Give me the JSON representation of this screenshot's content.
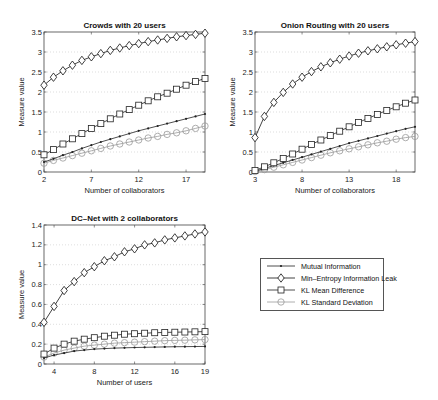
{
  "legend": {
    "items": [
      {
        "label": "Mutual Information",
        "marker": "dot",
        "color": "#222222"
      },
      {
        "label": "Min–Entropy Information Leak",
        "marker": "diamond",
        "color": "#111111"
      },
      {
        "label": "KL Mean Difference",
        "marker": "square",
        "color": "#222222"
      },
      {
        "label": "KL Standard Deviation",
        "marker": "circle",
        "color": "#999999"
      }
    ]
  },
  "chart_data": [
    {
      "type": "line",
      "title": "Crowds with 20 users",
      "xlabel": "Number of collaborators",
      "ylabel": "Measure value",
      "xlim": [
        2,
        19
      ],
      "ylim": [
        0,
        3.5
      ],
      "xticks": [
        2,
        7,
        12,
        17
      ],
      "yticks": [
        0,
        0.5,
        1,
        1.5,
        2,
        2.5,
        3,
        3.5
      ],
      "ytick_labels": [
        "0",
        "0.5",
        "1",
        "1.5",
        "2",
        "2.5",
        "3",
        "3.5"
      ],
      "grid": true,
      "x": [
        2,
        3,
        4,
        5,
        6,
        7,
        8,
        9,
        10,
        11,
        12,
        13,
        14,
        15,
        16,
        17,
        18,
        19
      ],
      "series": [
        {
          "name": "Mutual Information",
          "marker": "dot",
          "color": "#222222",
          "values": [
            0.25,
            0.33,
            0.42,
            0.5,
            0.59,
            0.67,
            0.75,
            0.82,
            0.89,
            0.96,
            1.03,
            1.09,
            1.15,
            1.21,
            1.27,
            1.33,
            1.39,
            1.45
          ]
        },
        {
          "name": "Min-Entropy Information Leak",
          "marker": "diamond",
          "color": "#111111",
          "values": [
            2.17,
            2.37,
            2.53,
            2.67,
            2.79,
            2.88,
            2.96,
            3.04,
            3.1,
            3.16,
            3.21,
            3.26,
            3.3,
            3.34,
            3.38,
            3.41,
            3.44,
            3.47
          ]
        },
        {
          "name": "KL Mean Difference",
          "marker": "square",
          "color": "#222222",
          "values": [
            0.43,
            0.56,
            0.7,
            0.83,
            0.96,
            1.09,
            1.21,
            1.33,
            1.45,
            1.56,
            1.67,
            1.78,
            1.88,
            1.97,
            2.07,
            2.17,
            2.26,
            2.34
          ]
        },
        {
          "name": "KL Standard Deviation",
          "marker": "circle",
          "color": "#999999",
          "values": [
            0.22,
            0.29,
            0.35,
            0.41,
            0.47,
            0.53,
            0.59,
            0.65,
            0.7,
            0.75,
            0.8,
            0.85,
            0.89,
            0.94,
            0.98,
            1.03,
            1.09,
            1.15
          ]
        }
      ]
    },
    {
      "type": "line",
      "title": "Onion Routing with 20 users",
      "xlabel": "Number of collaborators",
      "ylabel": "Measure value",
      "xlim": [
        3,
        20
      ],
      "ylim": [
        0,
        3.5
      ],
      "xticks": [
        3,
        8,
        13,
        18
      ],
      "yticks": [
        0,
        0.5,
        1,
        1.5,
        2,
        2.5,
        3,
        3.5
      ],
      "ytick_labels": [
        "0",
        "0.5",
        "1",
        "1.5",
        "2",
        "2.5",
        "3",
        "3.5"
      ],
      "grid": true,
      "x": [
        3,
        4,
        5,
        6,
        7,
        8,
        9,
        10,
        11,
        12,
        13,
        14,
        15,
        16,
        17,
        18,
        19,
        20
      ],
      "series": [
        {
          "name": "Mutual Information",
          "marker": "dot",
          "color": "#222222",
          "values": [
            0.02,
            0.09,
            0.16,
            0.23,
            0.3,
            0.37,
            0.44,
            0.51,
            0.58,
            0.65,
            0.72,
            0.78,
            0.84,
            0.9,
            0.96,
            1.02,
            1.08,
            1.13
          ]
        },
        {
          "name": "Min-Entropy Information Leak",
          "marker": "diamond",
          "color": "#111111",
          "values": [
            0.86,
            1.39,
            1.74,
            1.99,
            2.2,
            2.37,
            2.51,
            2.63,
            2.73,
            2.82,
            2.9,
            2.97,
            3.03,
            3.08,
            3.13,
            3.18,
            3.22,
            3.26
          ]
        },
        {
          "name": "KL Mean Difference",
          "marker": "square",
          "color": "#222222",
          "values": [
            0.04,
            0.13,
            0.23,
            0.34,
            0.45,
            0.57,
            0.69,
            0.8,
            0.91,
            1.02,
            1.13,
            1.24,
            1.34,
            1.44,
            1.54,
            1.63,
            1.72,
            1.8
          ]
        },
        {
          "name": "KL Standard Deviation",
          "marker": "circle",
          "color": "#999999",
          "values": [
            0.01,
            0.06,
            0.12,
            0.18,
            0.24,
            0.3,
            0.36,
            0.42,
            0.48,
            0.53,
            0.58,
            0.63,
            0.68,
            0.73,
            0.77,
            0.82,
            0.86,
            0.89
          ]
        }
      ]
    },
    {
      "type": "line",
      "title": "DC–Net with 2 collaborators",
      "xlabel": "Number of users",
      "ylabel": "Measure value",
      "xlim": [
        3,
        19
      ],
      "ylim": [
        0,
        1.4
      ],
      "xticks": [
        4,
        8,
        12,
        16,
        19
      ],
      "yticks": [
        0,
        0.2,
        0.4,
        0.6,
        0.8,
        1,
        1.2,
        1.4
      ],
      "ytick_labels": [
        "0",
        "0.2",
        "0.4",
        "0.6",
        "0.8",
        "1",
        "1.2",
        "1.4"
      ],
      "grid": true,
      "x": [
        3,
        4,
        5,
        6,
        7,
        8,
        9,
        10,
        11,
        12,
        13,
        14,
        15,
        16,
        17,
        18,
        19
      ],
      "series": [
        {
          "name": "Mutual Information",
          "marker": "dot",
          "color": "#222222",
          "values": [
            0.06,
            0.09,
            0.11,
            0.13,
            0.14,
            0.15,
            0.155,
            0.16,
            0.163,
            0.166,
            0.168,
            0.17,
            0.172,
            0.174,
            0.175,
            0.176,
            0.177
          ]
        },
        {
          "name": "Min-Entropy Information Leak",
          "marker": "diamond",
          "color": "#111111",
          "values": [
            0.42,
            0.58,
            0.74,
            0.83,
            0.92,
            0.98,
            1.04,
            1.08,
            1.13,
            1.16,
            1.2,
            1.22,
            1.25,
            1.27,
            1.29,
            1.31,
            1.33
          ]
        },
        {
          "name": "KL Mean Difference",
          "marker": "square",
          "color": "#222222",
          "values": [
            0.1,
            0.16,
            0.2,
            0.23,
            0.25,
            0.265,
            0.28,
            0.29,
            0.3,
            0.305,
            0.31,
            0.315,
            0.318,
            0.32,
            0.322,
            0.324,
            0.326
          ]
        },
        {
          "name": "KL Standard Deviation",
          "marker": "circle",
          "color": "#999999",
          "values": [
            0.07,
            0.11,
            0.14,
            0.16,
            0.18,
            0.19,
            0.2,
            0.21,
            0.215,
            0.22,
            0.225,
            0.23,
            0.235,
            0.238,
            0.24,
            0.243,
            0.246
          ]
        }
      ]
    }
  ],
  "layout": {
    "charts": [
      {
        "left": 44,
        "top": 32,
        "width": 161,
        "height": 140
      },
      {
        "left": 255,
        "top": 32,
        "width": 160,
        "height": 140
      },
      {
        "left": 44,
        "top": 225,
        "width": 161,
        "height": 139
      }
    ]
  }
}
